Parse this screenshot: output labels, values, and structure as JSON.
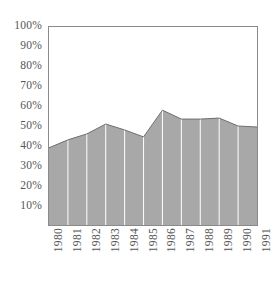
{
  "chart_data": {
    "type": "area",
    "title": "",
    "subtitle": "",
    "xlabel": "",
    "ylabel": "",
    "categories": [
      "1980",
      "1981",
      "1982",
      "1983",
      "1984",
      "1985",
      "1986",
      "1987",
      "1988",
      "1989",
      "1990",
      "1991"
    ],
    "values": [
      39,
      43,
      46,
      51,
      48,
      44.5,
      58,
      53.5,
      53.5,
      54,
      50,
      49.5
    ],
    "series": [
      {
        "name": "",
        "values": [
          39,
          43,
          46,
          51,
          48,
          44.5,
          58,
          53.5,
          53.5,
          54,
          50,
          49.5
        ]
      }
    ],
    "ylim": [
      0,
      100
    ],
    "xlim": [
      "1980",
      "1991"
    ],
    "y_ticks": [
      10,
      20,
      30,
      40,
      50,
      60,
      70,
      80,
      90,
      100
    ],
    "y_tick_labels": [
      "10%",
      "20%",
      "30%",
      "40%",
      "50%",
      "60%",
      "70%",
      "80%",
      "90%",
      "100%"
    ],
    "x_tick_labels": [
      "1980",
      "1981",
      "1982",
      "1983",
      "1984",
      "1985",
      "1986",
      "1987",
      "1988",
      "1989",
      "1990",
      "1991"
    ],
    "grid": "vertical-only",
    "legend": "none",
    "annotations": [],
    "colors": {
      "area_fill": "#a8a8a8",
      "area_line": "#6e6e6e",
      "gridline": "#ffffff",
      "frame": "#8a8a8a",
      "tick_text": "#555555",
      "background": "#ffffff"
    }
  }
}
